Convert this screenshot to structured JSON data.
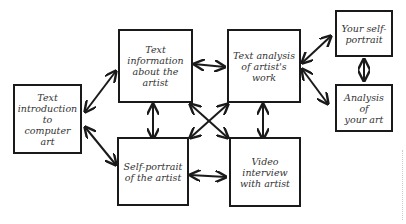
{
  "diagram": {
    "type": "flowchart",
    "style": "hand-drawn",
    "nodes": [
      {
        "id": "intro",
        "label": "Text\nintroduction to\ncomputer art"
      },
      {
        "id": "info",
        "label": "Text\ninformation\nabout the\nartist"
      },
      {
        "id": "analysis",
        "label": "Text analysis\nof artist's\nwork"
      },
      {
        "id": "selfportrait",
        "label": "Self-portrait\nof the artist"
      },
      {
        "id": "video",
        "label": "Video\ninterview\nwith artist"
      },
      {
        "id": "your_selfportrait",
        "label": "Your self-\nportrait"
      },
      {
        "id": "your_analysis",
        "label": "Analysis of\nyour art"
      }
    ],
    "edges": [
      {
        "from": "intro",
        "to": "info",
        "bidirectional": true
      },
      {
        "from": "intro",
        "to": "selfportrait",
        "bidirectional": true
      },
      {
        "from": "info",
        "to": "analysis",
        "bidirectional": true
      },
      {
        "from": "info",
        "to": "selfportrait",
        "bidirectional": true
      },
      {
        "from": "info",
        "to": "video",
        "bidirectional": true
      },
      {
        "from": "analysis",
        "to": "selfportrait",
        "bidirectional": true
      },
      {
        "from": "analysis",
        "to": "video",
        "bidirectional": true
      },
      {
        "from": "selfportrait",
        "to": "video",
        "bidirectional": true
      },
      {
        "from": "analysis",
        "to": "your_selfportrait",
        "bidirectional": true
      },
      {
        "from": "analysis",
        "to": "your_analysis",
        "bidirectional": true
      },
      {
        "from": "your_selfportrait",
        "to": "your_analysis",
        "bidirectional": true
      }
    ]
  }
}
